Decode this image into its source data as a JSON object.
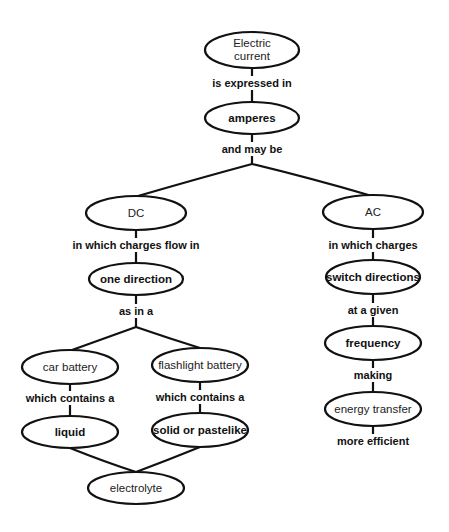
{
  "diagram": {
    "type": "concept-map",
    "nodes": {
      "electric_current": {
        "line1": "Electric",
        "line2": "current"
      },
      "amperes": {
        "label": "amperes"
      },
      "dc": {
        "label": "DC"
      },
      "ac": {
        "label": "AC"
      },
      "one_direction": {
        "label": "one direction"
      },
      "switch_directions": {
        "label": "switch directions"
      },
      "car_battery": {
        "label": "car battery"
      },
      "flashlight_battery": {
        "label": "flashlight battery"
      },
      "liquid": {
        "label": "liquid"
      },
      "solid_or_pastelike": {
        "label": "solid or pastelike"
      },
      "electrolyte": {
        "label": "electrolyte"
      },
      "frequency": {
        "label": "frequency"
      },
      "energy_transfer": {
        "label": "energy transfer"
      }
    },
    "links": {
      "is_expressed_in": "is expressed in",
      "and_may_be": "and may be",
      "in_which_charges_flow_in": "in which charges flow in",
      "in_which_charges": "in which charges",
      "as_in_a": "as in a",
      "which_contains_a_left": "which contains a",
      "which_contains_a_right": "which contains a",
      "at_a_given": "at a given",
      "making": "making",
      "more_efficient": "more efficient"
    },
    "colors": {
      "stroke": "#111111",
      "background": "#ffffff"
    }
  }
}
